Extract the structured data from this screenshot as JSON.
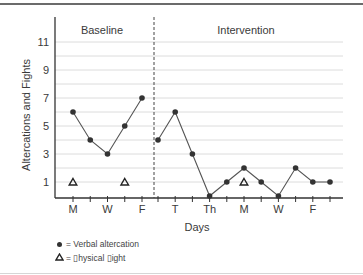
{
  "chart_data": {
    "type": "line",
    "title": "",
    "xlabel": "Days",
    "ylabel": "Altercations and Fights",
    "y_ticks": [
      1,
      3,
      5,
      7,
      9,
      11
    ],
    "ylim": [
      0,
      11
    ],
    "grid": true,
    "phases": [
      {
        "name": "Baseline",
        "x_ticks": [
          "M",
          "",
          "W",
          "",
          "F"
        ],
        "series": [
          {
            "name": "Verbal altercation",
            "marker": "dot",
            "values": [
              6,
              4,
              3,
              5,
              7
            ]
          },
          {
            "name": "Physical fight",
            "marker": "triangle",
            "values": [
              1,
              null,
              null,
              1,
              null
            ]
          }
        ]
      },
      {
        "name": "Intervention",
        "x_ticks": [
          "",
          "T",
          "",
          "Th",
          "",
          "M",
          "",
          "W",
          "",
          "F",
          ""
        ],
        "series": [
          {
            "name": "Verbal altercation",
            "marker": "dot",
            "values": [
              4,
              6,
              3,
              0,
              1,
              2,
              1,
              0,
              2,
              1,
              1
            ]
          },
          {
            "name": "Physical fight",
            "marker": "triangle",
            "values": [
              null,
              null,
              null,
              null,
              null,
              1,
              null,
              null,
              null,
              null,
              null
            ]
          }
        ]
      }
    ],
    "phase_divider": "dashed vertical line between Baseline and Intervention",
    "legend": [
      {
        "symbol": "dot",
        "label": "= Verbal altercation"
      },
      {
        "symbol": "triangle",
        "label": "= ▯hysical ▯ight"
      }
    ],
    "legend_position": "bottom-left"
  },
  "colors": {
    "line": "#555555",
    "marker": "#333333",
    "grid": "#dcdcdc",
    "axis": "#333333",
    "text": "#3a3a3a"
  }
}
